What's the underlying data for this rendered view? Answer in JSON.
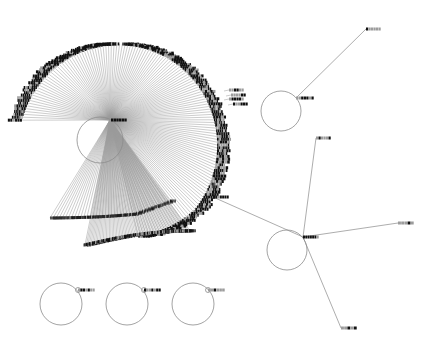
{
  "diagram": {
    "type": "network-graph",
    "legibility": "node labels rendered too small to read",
    "clusters": [
      {
        "name": "large-hub",
        "hub_label": "illegible",
        "self_loop": true,
        "leaf_count_outer_arc": 150,
        "leaf_count_lower_arc": 70,
        "side_labels": [
          "illegible",
          "illegible",
          "illegible",
          "illegible"
        ]
      },
      {
        "name": "right-top-node",
        "hub_label": "illegible",
        "self_loop": true,
        "neighbors": [
          "illegible"
        ]
      },
      {
        "name": "right-center-hub",
        "hub_label": "illegible",
        "self_loop": true,
        "neighbors": [
          "illegible",
          "illegible",
          "illegible",
          "illegible"
        ]
      },
      {
        "name": "bottom-node-1",
        "hub_label": "illegible",
        "self_loop": true
      },
      {
        "name": "bottom-node-2",
        "hub_label": "illegible",
        "self_loop": true
      },
      {
        "name": "bottom-node-3",
        "hub_label": "illegible",
        "self_loop": true
      }
    ],
    "colors": {
      "edge": "#9a9a9a",
      "label": "#111111",
      "background": "#ffffff"
    }
  }
}
